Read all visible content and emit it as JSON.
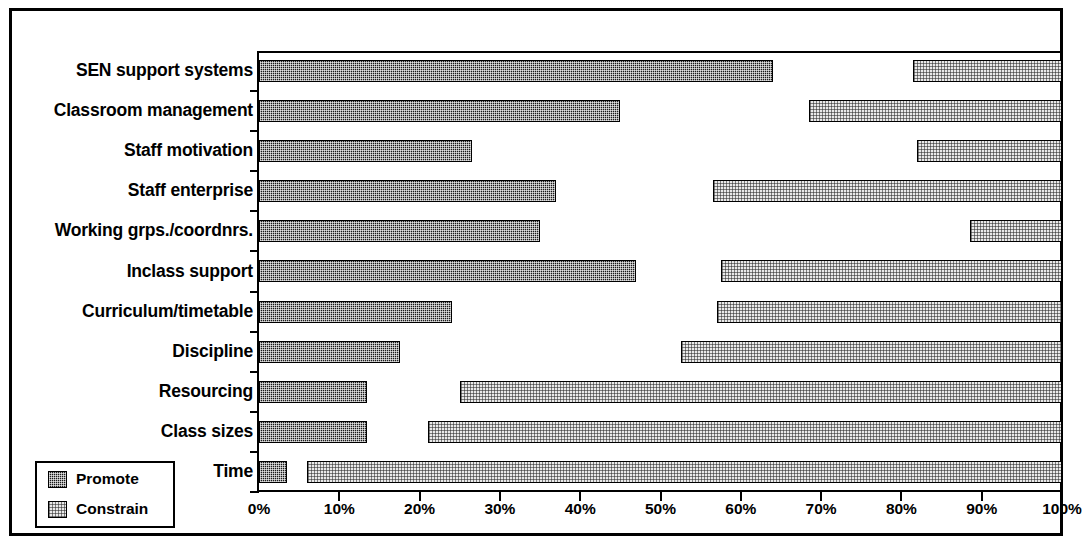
{
  "chart_data": {
    "type": "bar",
    "orientation": "horizontal",
    "title": "",
    "xlabel": "",
    "ylabel": "",
    "xlim": [
      0,
      100
    ],
    "xtick_labels": [
      "0%",
      "10%",
      "20%",
      "30%",
      "40%",
      "50%",
      "60%",
      "70%",
      "80%",
      "90%",
      "100%"
    ],
    "xtick_values": [
      0,
      10,
      20,
      30,
      40,
      50,
      60,
      70,
      80,
      90,
      100
    ],
    "grid": false,
    "legend_position": "bottom-left",
    "categories": [
      "SEN support systems",
      "Classroom management",
      "Staff motivation",
      "Staff enterprise",
      "Working grps./coordnrs.",
      "Inclass support",
      "Curriculum/timetable",
      "Discipline",
      "Resourcing",
      "Class sizes",
      "Time"
    ],
    "series": [
      {
        "name": "Promote",
        "color": "#1a1a1a",
        "pattern": "dense-checkerboard",
        "note": "bars start at 0% and extend rightwards",
        "start": [
          0,
          0,
          0,
          0,
          0,
          0,
          0,
          0,
          0,
          0,
          0
        ],
        "values": [
          64,
          45,
          26.5,
          37,
          35,
          47,
          24,
          17.5,
          13.5,
          13.5,
          3.5
        ]
      },
      {
        "name": "Constrain",
        "color": "#e9e9e9",
        "pattern": "light-checkerboard",
        "note": "bars start at the listed percentage and extend to 100%",
        "start": [
          81.5,
          68.5,
          82,
          56.5,
          88.5,
          57.5,
          57,
          52.5,
          25,
          21,
          6
        ],
        "values": [
          18.5,
          31.5,
          18,
          43.5,
          11.5,
          42.5,
          43,
          47.5,
          75,
          79,
          94
        ]
      }
    ]
  },
  "legend": {
    "items": [
      {
        "label": "Promote"
      },
      {
        "label": "Constrain"
      }
    ]
  }
}
